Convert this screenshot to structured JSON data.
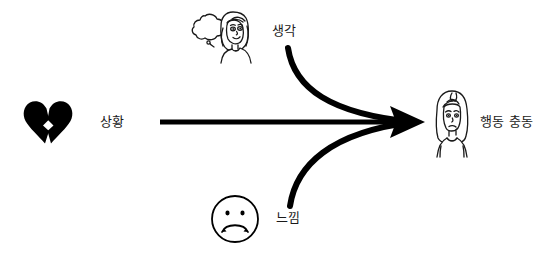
{
  "diagram": {
    "title": "",
    "background_color": "#ffffff",
    "stroke_color": "#000000",
    "nodes": [
      {
        "id": "situation",
        "label": "상황",
        "icon": "broken-heart-icon"
      },
      {
        "id": "thought",
        "label": "생각",
        "icon": "thinking-woman-icon"
      },
      {
        "id": "feeling",
        "label": "느낌",
        "icon": "sad-face-icon"
      },
      {
        "id": "urge",
        "label": "행동 충동",
        "icon": "worried-woman-icon"
      }
    ],
    "arrows": [
      {
        "id": "situation-to-urge",
        "from": "situation",
        "to": "urge",
        "shape": "straight"
      },
      {
        "id": "thought-to-urge",
        "from": "thought",
        "to": "urge",
        "shape": "curve-down"
      },
      {
        "id": "feeling-to-urge",
        "from": "feeling",
        "to": "urge",
        "shape": "curve-up"
      }
    ]
  }
}
